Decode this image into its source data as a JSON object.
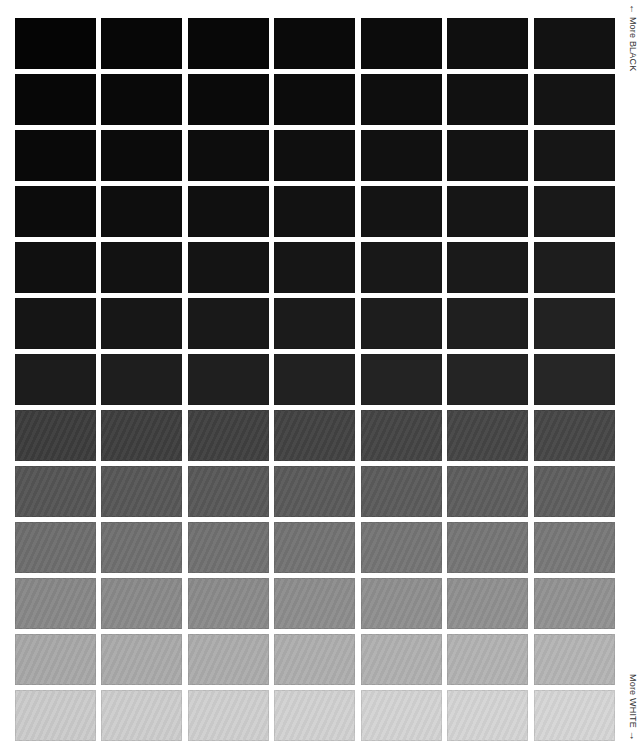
{
  "labels": {
    "top_arrow": "←",
    "top_text": "More BLACK",
    "bottom_text": "More WHITE",
    "bottom_arrow": "→"
  },
  "grid": {
    "rows": 13,
    "columns": 7,
    "cell_width": 81,
    "cell_height": 51,
    "col_pitch": 86,
    "row_pitch": 56,
    "colors": [
      [
        "#050505",
        "#070707",
        "#080808",
        "#0a0a0a",
        "#0c0c0c",
        "#0f0f0f",
        "#121212"
      ],
      [
        "#070707",
        "#090909",
        "#0a0a0a",
        "#0c0c0c",
        "#0e0e0e",
        "#111111",
        "#141414"
      ],
      [
        "#090909",
        "#0b0b0b",
        "#0d0d0d",
        "#0f0f0f",
        "#111111",
        "#131313",
        "#161616"
      ],
      [
        "#0c0c0c",
        "#0e0e0e",
        "#101010",
        "#121212",
        "#141414",
        "#161616",
        "#191919"
      ],
      [
        "#101010",
        "#121212",
        "#141414",
        "#161616",
        "#181818",
        "#1a1a1a",
        "#1d1d1d"
      ],
      [
        "#151515",
        "#171717",
        "#191919",
        "#1b1b1b",
        "#1d1d1d",
        "#1f1f1f",
        "#222222"
      ],
      [
        "#1c1c1c",
        "#1e1e1e",
        "#1f1f1f",
        "#212121",
        "#232323",
        "#242424",
        "#262626"
      ],
      [
        "#3c3c3c",
        "#3e3e3e",
        "#404040",
        "#424242",
        "#444444",
        "#454545",
        "#474747"
      ],
      [
        "#555555",
        "#575757",
        "#585858",
        "#5a5a5a",
        "#5b5b5b",
        "#5d5d5d",
        "#5e5e5e"
      ],
      [
        "#6e6e6e",
        "#707070",
        "#717171",
        "#737373",
        "#757575",
        "#767676",
        "#787878"
      ],
      [
        "#888888",
        "#8a8a8a",
        "#8b8b8b",
        "#8d8d8d",
        "#8f8f8f",
        "#909090",
        "#929292"
      ],
      [
        "#a8a8a8",
        "#aaaaaa",
        "#acacac",
        "#aeaeae",
        "#b0b0b0",
        "#b2b2b2",
        "#b4b4b4"
      ],
      [
        "#cbcbcb",
        "#cdcdcd",
        "#cfcfcf",
        "#d1d1d1",
        "#d3d3d3",
        "#d4d4d4",
        "#d6d6d6"
      ]
    ]
  }
}
